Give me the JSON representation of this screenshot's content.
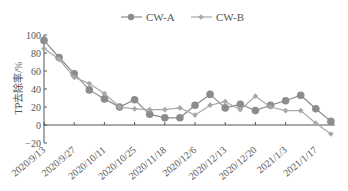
{
  "chart_data": {
    "type": "line",
    "title": "",
    "xlabel": "",
    "ylabel": "TP去除率/%",
    "ylim": [
      -20,
      100
    ],
    "yticks": [
      -20,
      0,
      20,
      40,
      60,
      80,
      100
    ],
    "grid": false,
    "legend_position": "top",
    "x": [
      "p1",
      "p2",
      "p3",
      "p4",
      "p5",
      "p6",
      "p7",
      "p8",
      "p9",
      "p10",
      "p11",
      "p12",
      "p13",
      "p14",
      "p15",
      "p16",
      "p17",
      "p18",
      "p19",
      "p20"
    ],
    "tick_labels": [
      "2020/9/13",
      "2020/9/27",
      "2020/10/11",
      "2020/10/25",
      "2020/11/18",
      "2020/12/6",
      "2020/12/13",
      "2020/12/20",
      "2021/1/3",
      "2021/1/17"
    ],
    "series": [
      {
        "name": "CW-A",
        "marker": "circle",
        "color": "#8c8c8c",
        "values": [
          94,
          75,
          57,
          39,
          29,
          20,
          28,
          12,
          8,
          8,
          22,
          34,
          19,
          23,
          16,
          22,
          27,
          33,
          18,
          4
        ]
      },
      {
        "name": "CW-B",
        "marker": "diamond",
        "color": "#a8a8a8",
        "values": [
          85,
          73,
          53,
          46,
          35,
          20,
          18,
          17,
          17,
          19,
          11,
          22,
          26,
          17,
          32,
          20,
          16,
          16,
          2,
          -10
        ]
      }
    ]
  },
  "legend": {
    "a": "CW-A",
    "b": "CW-B"
  },
  "axis": {
    "ylabel": "TP去除率/%"
  }
}
